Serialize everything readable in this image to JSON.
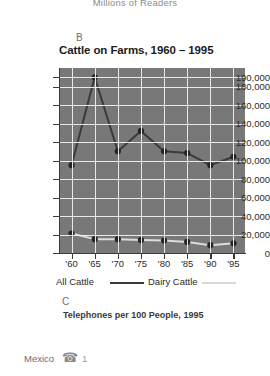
{
  "top_caption": "Millions of Readers",
  "section_b": {
    "letter": "B",
    "title": "Cattle on Farms, 1960 – 1995"
  },
  "section_c": {
    "letter": "C",
    "title": "Telephones per 100 People, 1995",
    "rows": [
      {
        "country": "Mexico",
        "icon": "telephone-icon",
        "glyph": "☎",
        "value": "1"
      }
    ]
  },
  "legend": {
    "items": [
      {
        "label": "All Cattle",
        "color": "#3a3a3a"
      },
      {
        "label": "Dairy Cattle",
        "color": "#d8d8d8"
      }
    ]
  },
  "colors": {
    "plot_background": "#787878",
    "gridline": "#e9e9e9",
    "axis": "#3a3a3a",
    "all_cattle": "#3a3a3a",
    "dairy_cattle": "#dcdcdc",
    "page_background": "#ffffff"
  },
  "chart_data": {
    "type": "line",
    "title": "Cattle on Farms, 1960 – 1995",
    "xlabel": "",
    "ylabel": "",
    "categories": [
      "'60",
      "'65",
      "'70",
      "'75",
      "'80",
      "'85",
      "'90",
      "'95"
    ],
    "ylim": [
      0,
      200000
    ],
    "ytick_values": [
      0,
      20000,
      40000,
      60000,
      80000,
      100000,
      120000,
      140000,
      160000,
      180000,
      190000
    ],
    "ytick_labels": [
      "0",
      "20,000",
      "40,000",
      "60,000",
      "80,000",
      "100,000",
      "120,000",
      "140,000",
      "160,000",
      "180,000",
      "190,000"
    ],
    "grid": true,
    "legend_position": "bottom",
    "markers": true,
    "series": [
      {
        "name": "All Cattle",
        "color": "#3a3a3a",
        "values": [
          95000,
          190000,
          110000,
          132000,
          110000,
          108000,
          95000,
          104000
        ]
      },
      {
        "name": "Dairy Cattle",
        "color": "#dcdcdc",
        "values": [
          21000,
          15000,
          15000,
          14000,
          13500,
          12000,
          8500,
          10500
        ]
      }
    ]
  }
}
